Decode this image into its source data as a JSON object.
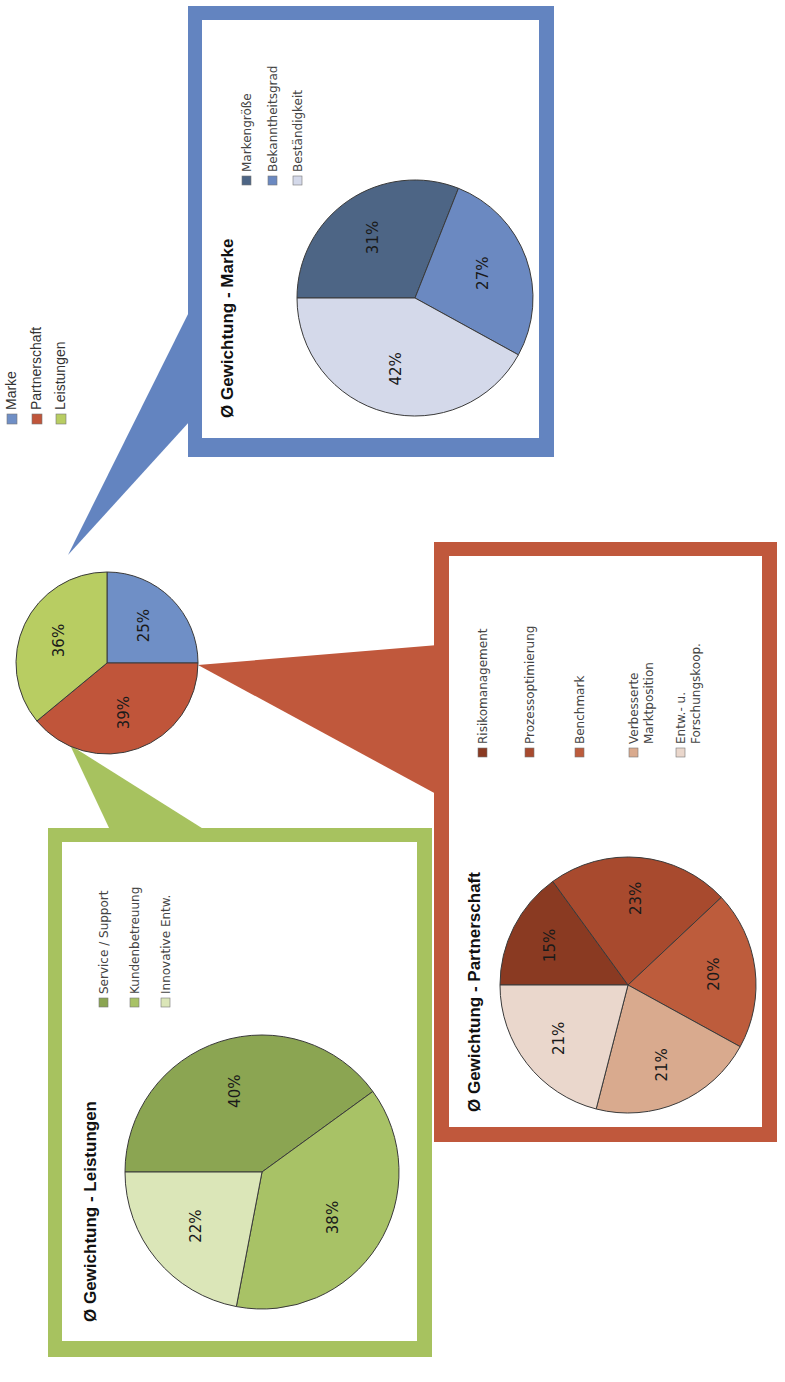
{
  "chart_data": [
    {
      "type": "pie",
      "name": "overview",
      "title": "",
      "categories": [
        "Marke",
        "Partnerschaft",
        "Leistungen"
      ],
      "values": [
        25,
        39,
        36
      ],
      "labels": [
        "25%",
        "39%",
        "36%"
      ],
      "colors": [
        "#6f8fc6",
        "#c0553a",
        "#b8cd62"
      ],
      "legend": [
        "Marke",
        "Partnerschaft",
        "Leistungen"
      ],
      "legend_placement": "right"
    },
    {
      "type": "pie",
      "name": "marke",
      "title": "Ø Gewichtung - Marke",
      "categories": [
        "Markengröße",
        "Bekanntheitsgrad",
        "Beständigkeit"
      ],
      "values": [
        31,
        27,
        42
      ],
      "labels": [
        "31%",
        "27%",
        "42%"
      ],
      "colors": [
        "#4d6585",
        "#6b89c1",
        "#d4d9ea"
      ],
      "legend": [
        "Markengröße",
        "Bekanntheitsgrad",
        "Beständigkeit"
      ],
      "legend_placement": "right"
    },
    {
      "type": "pie",
      "name": "partnerschaft",
      "title": "Ø Gewichtung - Partnerschaft",
      "categories": [
        "Risikomanagement",
        "Prozessoptimierung",
        "Benchmark",
        "Verbesserte Marktposition",
        "Entw.- u. Forschungskoop."
      ],
      "values": [
        15,
        23,
        20,
        21,
        21
      ],
      "labels": [
        "15%",
        "23%",
        "20%",
        "21%",
        "21%"
      ],
      "colors": [
        "#8a3a22",
        "#a84a2e",
        "#bd5c3c",
        "#d9aa8e",
        "#ead7cc"
      ],
      "legend": [
        "Risikomanagement",
        "Prozessoptimierung",
        "Benchmark",
        "Verbesserte Marktposition",
        "Entw.- u. Forschungskoop."
      ],
      "legend_placement": "right"
    },
    {
      "type": "pie",
      "name": "leistungen",
      "title": "Ø Gewichtung - Leistungen",
      "categories": [
        "Service / Support",
        "Kundenbetreuung",
        "Innovative Entw."
      ],
      "values": [
        40,
        38,
        22
      ],
      "labels": [
        "40%",
        "38%",
        "22%"
      ],
      "colors": [
        "#8ba552",
        "#a8c266",
        "#dbe6b8"
      ],
      "legend": [
        "Service / Support",
        "Kundenbetreuung",
        "Innovative Entw."
      ],
      "legend_placement": "right"
    }
  ],
  "frame_colors": {
    "marke": "#6384c0",
    "partnerschaft": "#c0583c",
    "leistungen": "#a7c25f"
  }
}
